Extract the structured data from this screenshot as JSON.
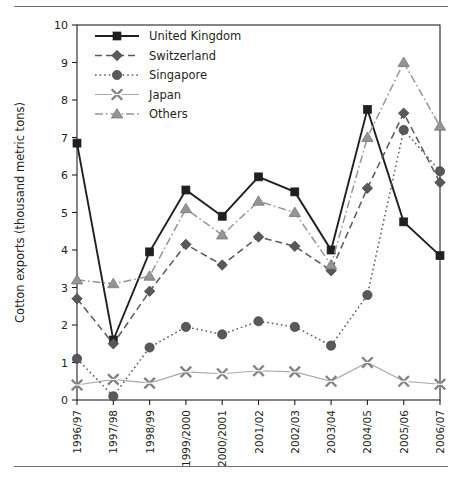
{
  "figure": {
    "top_rule": "horizontal-rule",
    "bottom_rule": "horizontal-rule"
  },
  "chart_data": {
    "type": "line",
    "title": "",
    "xlabel": "",
    "ylabel": "Cotton exports (thousand metric tons)",
    "ylim": [
      0,
      10
    ],
    "yticks": [
      "0",
      "1",
      "2",
      "3",
      "4",
      "5",
      "6",
      "7",
      "8",
      "9",
      "10"
    ],
    "grid": false,
    "legend_position": "top-left inside plot",
    "categories": [
      "1996/97",
      "1997/98",
      "1998/99",
      "1999/2000",
      "2000/2001",
      "2001/02",
      "2002/03",
      "2003/04",
      "2004/05",
      "2005/06",
      "2006/07"
    ],
    "series": [
      {
        "name": "United Kingdom",
        "marker": "square",
        "line": "solid",
        "color": "#231f20",
        "values": [
          6.85,
          1.6,
          3.95,
          5.6,
          4.9,
          5.95,
          5.55,
          4.0,
          7.75,
          4.75,
          3.85
        ]
      },
      {
        "name": "Switzerland",
        "marker": "diamond",
        "line": "dashed",
        "color": "#58595b",
        "values": [
          2.7,
          1.5,
          2.9,
          4.15,
          3.6,
          4.35,
          4.1,
          3.45,
          5.65,
          7.65,
          5.8
        ]
      },
      {
        "name": "Singapore",
        "marker": "circle",
        "line": "dotted",
        "color": "#58595b",
        "values": [
          1.1,
          0.1,
          1.4,
          1.95,
          1.75,
          2.1,
          1.95,
          1.45,
          2.8,
          7.2,
          6.1
        ]
      },
      {
        "name": "Japan",
        "marker": "cross",
        "line": "solid-light",
        "color": "#a7a9ac",
        "values": [
          0.4,
          0.55,
          0.45,
          0.75,
          0.7,
          0.78,
          0.75,
          0.5,
          1.0,
          0.5,
          0.42
        ]
      },
      {
        "name": "Others",
        "marker": "triangle",
        "line": "dashdot",
        "color": "#939598",
        "values": [
          3.2,
          3.1,
          3.3,
          5.1,
          4.4,
          5.3,
          5.0,
          3.6,
          7.0,
          9.0,
          7.3
        ]
      }
    ]
  }
}
